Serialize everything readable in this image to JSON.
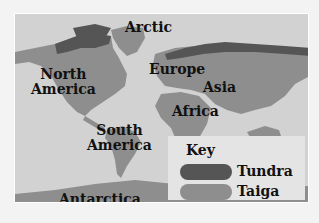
{
  "map": {
    "labels": {
      "arctic": "Arctic",
      "north_america": "North\nAmerica",
      "europe": "Europe",
      "asia": "Asia",
      "africa": "Africa",
      "south_america": "South\nAmerica",
      "antarctica": "Antarctica"
    },
    "colors": {
      "ocean": "#d2d2d2",
      "land": "#e6e6e6",
      "tundra": "#555555",
      "taiga": "#8e8e8e"
    }
  },
  "key": {
    "title": "Key",
    "items": [
      {
        "label": "Tundra",
        "color": "#555555"
      },
      {
        "label": "Taiga",
        "color": "#8e8e8e"
      }
    ]
  }
}
